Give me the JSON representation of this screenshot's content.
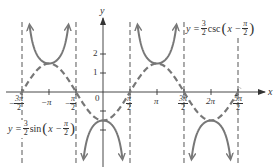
{
  "chart_data": {
    "type": "line",
    "title": "",
    "xlabel": "x",
    "ylabel": "y",
    "grid": false,
    "x_ticks": [
      "-3π/2",
      "-π",
      "-π/2",
      "π/2",
      "π",
      "3π/2",
      "2π",
      "5π/2"
    ],
    "x_tick_values": [
      -4.712,
      -3.1416,
      -1.5708,
      1.5708,
      3.1416,
      4.712,
      6.2832,
      7.854
    ],
    "y_ticks": [
      "1",
      "2"
    ],
    "y_tick_values": [
      1,
      2
    ],
    "origin_label": "0",
    "xlim": [
      -5.9,
      9.9
    ],
    "ylim": [
      -3.9,
      4.5
    ],
    "asymptotes": [
      -4.712,
      -1.5708,
      1.5708,
      4.712,
      7.854
    ],
    "series": [
      {
        "name": "y = 3/2 sin(x − π/2)",
        "style": "dashed",
        "function": "1.5*sin(x - pi/2)",
        "x": [
          -4.712,
          -3.1416,
          -1.5708,
          0,
          1.5708,
          3.1416,
          4.712,
          6.2832,
          7.854
        ],
        "y": [
          0,
          1.5,
          0,
          -1.5,
          0,
          1.5,
          0,
          -1.5,
          0
        ]
      },
      {
        "name": "y = 3/2 csc(x − π/2)",
        "style": "solid",
        "function": "1.5/sin(x - pi/2)",
        "branches": [
          {
            "interval": [
              -4.712,
              -1.5708
            ],
            "vertex": [
              -3.1416,
              1.5
            ],
            "opens": "up"
          },
          {
            "interval": [
              -1.5708,
              1.5708
            ],
            "vertex": [
              0,
              -1.5
            ],
            "opens": "down"
          },
          {
            "interval": [
              1.5708,
              4.712
            ],
            "vertex": [
              3.1416,
              1.5
            ],
            "opens": "up"
          },
          {
            "interval": [
              4.712,
              7.854
            ],
            "vertex": [
              6.2832,
              -1.5
            ],
            "opens": "down"
          }
        ]
      }
    ],
    "annotations": [
      {
        "text": "y = 3/2 csc(x − π/2)",
        "position": "upper right"
      },
      {
        "text": "y = 3/2 sin(x − π/2)",
        "position": "lower left"
      }
    ]
  },
  "labels": {
    "x_axis": "x",
    "y_axis": "y",
    "origin": "0",
    "y_tick_1": "1",
    "y_tick_2": "2",
    "pi": "π",
    "neg_pi": "−π",
    "two_pi": "2π",
    "neg": "−",
    "three_pi": "3π",
    "five_pi": "5π",
    "two": "2",
    "three": "3"
  },
  "equations": {
    "csc": {
      "lhs": "y = ",
      "func": "csc",
      "arg": "x − "
    },
    "sin": {
      "lhs": "y = ",
      "func": "sin",
      "arg": "x − "
    }
  }
}
